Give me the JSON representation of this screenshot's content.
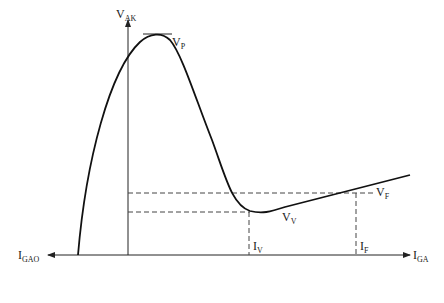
{
  "diagram": {
    "labels": {
      "y_axis": {
        "main": "V",
        "sub": "AK"
      },
      "x_axis": {
        "main": "I",
        "sub": "GA"
      },
      "x_axis_negative": {
        "main": "I",
        "sub": "GAO"
      },
      "peak": {
        "main": "V",
        "sub": "P"
      },
      "valley": {
        "main": "V",
        "sub": "V"
      },
      "forward": {
        "main": "V",
        "sub": "F"
      },
      "valley_current": {
        "main": "I",
        "sub": "V"
      },
      "forward_current": {
        "main": "I",
        "sub": "F"
      }
    }
  }
}
